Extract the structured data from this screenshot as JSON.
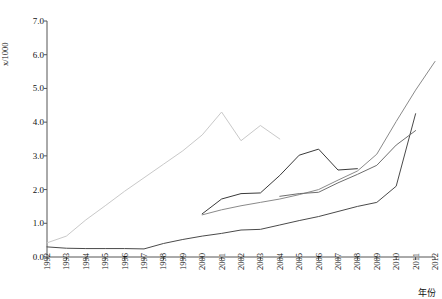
{
  "chart_data": {
    "type": "line",
    "title": "",
    "xlabel": "年份",
    "ylabel": "x/1000",
    "xlim": [
      1992,
      2012
    ],
    "ylim": [
      0.0,
      7.0
    ],
    "grid": false,
    "legend": "none",
    "x_tick_labels": [
      "1992",
      "1993",
      "1994",
      "1995",
      "1996",
      "1997",
      "1998",
      "1999",
      "2000",
      "2001",
      "2002",
      "2003",
      "2004",
      "2005",
      "2006",
      "2007",
      "2008",
      "2009",
      "2010",
      "2011",
      "2012"
    ],
    "y_tick_labels": [
      "0.0",
      "1.0",
      "2.0",
      "3.0",
      "4.0",
      "5.0",
      "6.0",
      "7.0"
    ],
    "y_tick_values": [
      0.0,
      1.0,
      2.0,
      3.0,
      4.0,
      5.0,
      6.0,
      7.0
    ],
    "series": [
      {
        "name": "series-1",
        "color": "#c9c9c9",
        "x": [
          1992,
          1993,
          1994,
          1995,
          1996,
          1997,
          1998,
          1999,
          2000,
          2001,
          2002,
          2003,
          2004
        ],
        "values": [
          0.42,
          0.62,
          1.1,
          1.52,
          1.95,
          2.35,
          2.75,
          3.15,
          3.62,
          4.3,
          3.45,
          3.9,
          3.5
        ]
      },
      {
        "name": "series-2",
        "color": "#4a4a4a",
        "x": [
          1992,
          1993,
          1994,
          1995,
          1996,
          1997,
          1998,
          1999,
          2000,
          2001,
          2002,
          2003,
          2004,
          2005,
          2006,
          2007,
          2008,
          2009,
          2010,
          2011
        ],
        "values": [
          0.3,
          0.26,
          0.25,
          0.25,
          0.25,
          0.24,
          0.4,
          0.52,
          0.62,
          0.7,
          0.8,
          0.82,
          0.95,
          1.08,
          1.2,
          1.35,
          1.5,
          1.62,
          2.1,
          4.25
        ]
      },
      {
        "name": "series-3",
        "color": "#3a3a3a",
        "x": [
          2000,
          2001,
          2002,
          2003,
          2004,
          2005,
          2006,
          2007,
          2008
        ],
        "values": [
          1.28,
          1.72,
          1.88,
          1.9,
          2.42,
          3.02,
          3.2,
          2.58,
          2.62
        ]
      },
      {
        "name": "series-4",
        "color": "#8a8a8a",
        "x": [
          2000,
          2001,
          2002,
          2003,
          2004,
          2005,
          2006,
          2007,
          2008,
          2009,
          2010,
          2011,
          2012
        ],
        "values": [
          1.25,
          1.4,
          1.52,
          1.62,
          1.72,
          1.85,
          2.0,
          2.28,
          2.55,
          3.05,
          4.02,
          4.95,
          5.8
        ]
      },
      {
        "name": "series-5",
        "color": "#6e6e6e",
        "x": [
          2004,
          2005,
          2006,
          2007,
          2008,
          2009,
          2010,
          2011
        ],
        "values": [
          1.8,
          1.88,
          1.92,
          2.2,
          2.45,
          2.72,
          3.32,
          3.75
        ]
      }
    ]
  },
  "axis": {
    "y_axis_label": "x/1000",
    "x_axis_label": "年份"
  }
}
